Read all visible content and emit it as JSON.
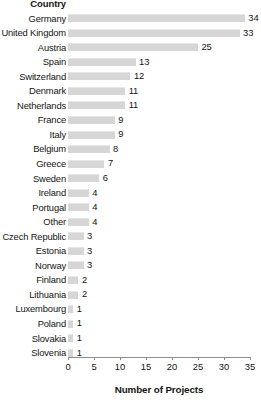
{
  "chart_data": {
    "type": "bar",
    "orientation": "horizontal",
    "title": "",
    "xlabel": "Number of Projects",
    "ylabel": "Country",
    "xlim": [
      0,
      35
    ],
    "xticks": [
      0,
      5,
      10,
      15,
      20,
      25,
      30,
      35
    ],
    "grid": false,
    "legend": null,
    "bar_color": "#d6d6d6",
    "categories": [
      "Germany",
      "United Kingdom",
      "Austria",
      "Spain",
      "Switzerland",
      "Denmark",
      "Netherlands",
      "France",
      "Italy",
      "Belgium",
      "Greece",
      "Sweden",
      "Ireland",
      "Portugal",
      "Other",
      "Czech Republic",
      "Estonia",
      "Norway",
      "Finland",
      "Lithuania",
      "Luxembourg",
      "Poland",
      "Slovakia",
      "Slovenia"
    ],
    "values": [
      34,
      33,
      25,
      13,
      12,
      11,
      11,
      9,
      9,
      8,
      7,
      6,
      4,
      4,
      4,
      3,
      3,
      3,
      2,
      2,
      1,
      1,
      1,
      1
    ]
  }
}
